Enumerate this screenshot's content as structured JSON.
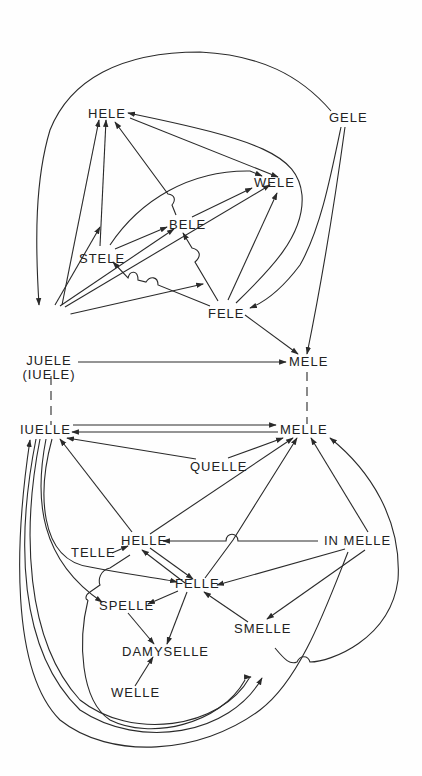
{
  "diagram": {
    "title": "",
    "colors": {
      "line": "#2a2a2a",
      "text": "#222222",
      "background": "#fefefe"
    },
    "nodes": {
      "hele": {
        "label": "HELE"
      },
      "gele": {
        "label": "GELE"
      },
      "wele": {
        "label": "WELE"
      },
      "bele": {
        "label": "BELE"
      },
      "stele": {
        "label": "STELE"
      },
      "fele": {
        "label": "FELE"
      },
      "juele": {
        "label": "JUELE",
        "sublabel": "(IUELE)"
      },
      "mele": {
        "label": "MELE"
      },
      "iuelle": {
        "label": "IUELLE"
      },
      "melle": {
        "label": "MELLE"
      },
      "quelle": {
        "label": "QUELLE"
      },
      "helle": {
        "label": "HELLE"
      },
      "telle": {
        "label": "TELLE"
      },
      "in_melle": {
        "label": "IN MELLE"
      },
      "felle": {
        "label": "FELLE"
      },
      "spelle": {
        "label": "SPELLE"
      },
      "smelle": {
        "label": "SMELLE"
      },
      "damyselle": {
        "label": "DAMYSELLE"
      },
      "welle": {
        "label": "WELLE"
      }
    },
    "edges": [
      {
        "from": "GELE",
        "to": "JUELE",
        "style": "curved"
      },
      {
        "from": "GELE",
        "to": "FELE",
        "style": "curved"
      },
      {
        "from": "GELE",
        "to": "MELE",
        "style": "straight"
      },
      {
        "from": "HELE",
        "to": "WELE"
      },
      {
        "from": "FELE",
        "to": "HELE",
        "style": "curved"
      },
      {
        "from": "FELE",
        "to": "BELE"
      },
      {
        "from": "FELE",
        "to": "STELE"
      },
      {
        "from": "FELE",
        "to": "WELE"
      },
      {
        "from": "FELE",
        "to": "MELE"
      },
      {
        "from": "BELE",
        "to": "HELE"
      },
      {
        "from": "BELE",
        "to": "WELE"
      },
      {
        "from": "STELE",
        "to": "HELE"
      },
      {
        "from": "STELE",
        "to": "BELE"
      },
      {
        "from": "STELE",
        "to": "WELE",
        "style": "curved"
      },
      {
        "from": "JUELE",
        "to": "HELE"
      },
      {
        "from": "JUELE",
        "to": "STELE"
      },
      {
        "from": "JUELE",
        "to": "BELE"
      },
      {
        "from": "JUELE",
        "to": "WELE"
      },
      {
        "from": "JUELE",
        "to": "FELE"
      },
      {
        "from": "JUELE",
        "to": "MELE"
      },
      {
        "from": "JUELE",
        "to": "IUELLE",
        "style": "dashed"
      },
      {
        "from": "MELE",
        "to": "MELLE",
        "style": "dashed"
      },
      {
        "from": "IUELLE",
        "to": "MELLE"
      },
      {
        "from": "MELLE",
        "to": "IUELLE"
      },
      {
        "from": "QUELLE",
        "to": "IUELLE"
      },
      {
        "from": "QUELLE",
        "to": "MELLE"
      },
      {
        "from": "HELLE",
        "to": "IUELLE"
      },
      {
        "from": "HELLE",
        "to": "MELLE"
      },
      {
        "from": "HELLE",
        "to": "FELLE"
      },
      {
        "from": "HELLE",
        "to": "SPELLE"
      },
      {
        "from": "FELLE",
        "to": "HELLE"
      },
      {
        "from": "FELLE",
        "to": "MELLE"
      },
      {
        "from": "FELLE",
        "to": "SPELLE"
      },
      {
        "from": "FELLE",
        "to": "DAMYSELLE"
      },
      {
        "from": "TELLE",
        "to": "HELLE"
      },
      {
        "from": "IN MELLE",
        "to": "HELLE"
      },
      {
        "from": "IN MELLE",
        "to": "MELLE"
      },
      {
        "from": "IN MELLE",
        "to": "FELLE"
      },
      {
        "from": "IN MELLE",
        "to": "SMELLE"
      },
      {
        "from": "SMELLE",
        "to": "FELLE"
      },
      {
        "from": "SMELLE",
        "to": "MELLE",
        "style": "curved"
      },
      {
        "from": "SPELLE",
        "to": "DAMYSELLE"
      },
      {
        "from": "WELLE",
        "to": "DAMYSELLE"
      },
      {
        "from": "IUELLE",
        "to": "FELLE",
        "style": "curved"
      },
      {
        "from": "IUELLE",
        "to": "SPELLE",
        "style": "curved"
      },
      {
        "from": "IUELLE",
        "to": "SMELLE",
        "style": "curved"
      },
      {
        "from": "IN MELLE",
        "to": "IUELLE",
        "style": "curved"
      }
    ]
  }
}
